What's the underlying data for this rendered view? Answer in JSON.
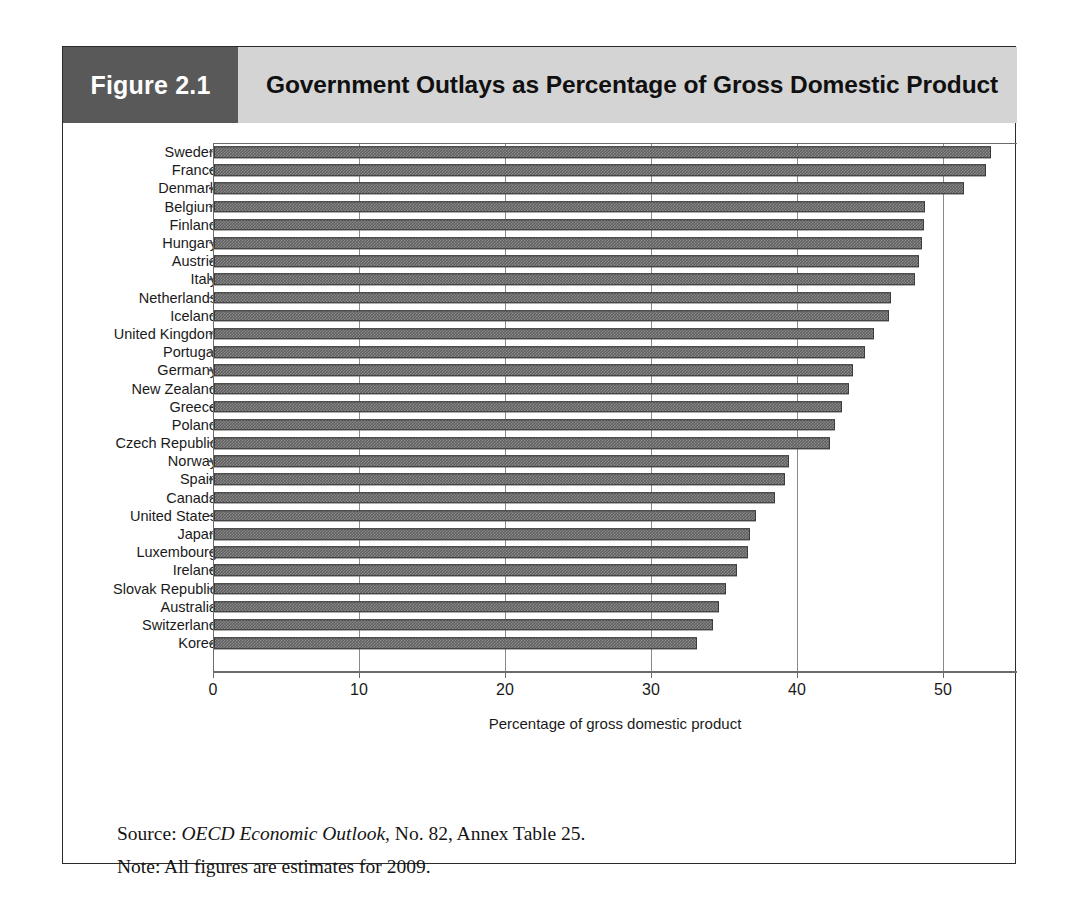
{
  "figure": {
    "number_label": "Figure 2.1",
    "title": "Government Outlays as Percentage of Gross Domestic Product"
  },
  "notes": {
    "source_prefix": "Source: ",
    "source_italic": "OECD Economic Outlook",
    "source_suffix": ", No. 82, Annex Table 25.",
    "note": "Note: All figures are estimates for 2009."
  },
  "colors": {
    "header_number_bg": "#595959",
    "header_title_bg": "#d4d4d4",
    "bar_fill": "#5d5d5d",
    "bar_border": "#3c3c3c",
    "axis": "#6b6b6b",
    "frame": "#2b2b2b"
  },
  "chart_data": {
    "type": "bar",
    "orientation": "horizontal",
    "title": "Government Outlays as Percentage of Gross Domestic Product",
    "xlabel": "Percentage of gross domestic product",
    "ylabel": "",
    "xlim": [
      0,
      55
    ],
    "xticks": [
      0,
      10,
      20,
      30,
      40,
      50
    ],
    "xtick_labels": [
      "0",
      "10",
      "20",
      "30",
      "40",
      "50"
    ],
    "grid": true,
    "grid_axis": "x",
    "legend": false,
    "categories": [
      "Sweden",
      "France",
      "Denmark",
      "Belgium",
      "Finland",
      "Hungary",
      "Austria",
      "Italy",
      "Netherlands",
      "Iceland",
      "United Kingdom",
      "Portugal",
      "Germany",
      "New Zealand",
      "Greece",
      "Poland",
      "Czech Republic",
      "Norway",
      "Spain",
      "Canada",
      "United States",
      "Japan",
      "Luxembourg",
      "Ireland",
      "Slovak Republic",
      "Australia",
      "Switzerland",
      "Korea"
    ],
    "values": [
      53.2,
      52.9,
      51.4,
      48.7,
      48.6,
      48.5,
      48.3,
      48.0,
      46.4,
      46.2,
      45.2,
      44.6,
      43.8,
      43.5,
      43.0,
      42.5,
      42.2,
      39.4,
      39.1,
      38.4,
      37.1,
      36.7,
      36.6,
      35.8,
      35.1,
      34.6,
      34.2,
      33.1
    ]
  }
}
